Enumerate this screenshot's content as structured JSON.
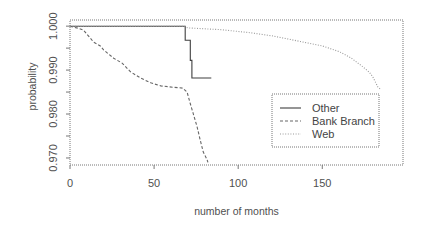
{
  "chart_data": {
    "type": "line",
    "title": "",
    "xlabel": "number of months",
    "ylabel": "probability",
    "xlim": [
      0,
      198
    ],
    "ylim": [
      0.9684,
      1.0014
    ],
    "grid": false,
    "legend_position": "inside-right",
    "xticks": [
      0,
      50,
      100,
      150
    ],
    "xtick_labels": [
      "0",
      "50",
      "100",
      "150"
    ],
    "yticks": [
      0.97,
      0.975,
      0.98,
      0.985,
      0.99,
      0.995,
      1.0
    ],
    "ytick_labels": [
      "0.970",
      "",
      "0.980",
      "",
      "0.990",
      "",
      "1.000"
    ],
    "series": [
      {
        "name": "Other",
        "line_style": "solid",
        "color": "#3f3f3f",
        "step": true,
        "points": [
          [
            0,
            1.0
          ],
          [
            68.5,
            1.0
          ],
          [
            68.5,
            0.9968
          ],
          [
            71.5,
            0.9968
          ],
          [
            71.5,
            0.9922
          ],
          [
            72.5,
            0.9922
          ],
          [
            72.5,
            0.9882
          ],
          [
            84,
            0.9882
          ]
        ]
      },
      {
        "name": "Bank Branch",
        "line_style": "dashed",
        "color": "#666666",
        "step": false,
        "points": [
          [
            0,
            1.0
          ],
          [
            5,
            0.9995
          ],
          [
            8,
            0.9991
          ],
          [
            14,
            0.9964
          ],
          [
            18,
            0.9955
          ],
          [
            20,
            0.9946
          ],
          [
            26,
            0.9927
          ],
          [
            31,
            0.9916
          ],
          [
            36,
            0.9896
          ],
          [
            42,
            0.9882
          ],
          [
            48,
            0.9871
          ],
          [
            54,
            0.9864
          ],
          [
            61,
            0.9861
          ],
          [
            67,
            0.9859
          ],
          [
            69.6,
            0.985
          ],
          [
            71.4,
            0.9825
          ],
          [
            73.2,
            0.9802
          ],
          [
            75.6,
            0.9771
          ],
          [
            77.4,
            0.9741
          ],
          [
            79.2,
            0.9714
          ],
          [
            81.5,
            0.9696
          ],
          [
            82,
            0.969
          ]
        ]
      },
      {
        "name": "Web",
        "line_style": "dotted",
        "color": "#9a9a9a",
        "step": false,
        "points": [
          [
            0,
            1.0
          ],
          [
            68,
            1.0
          ],
          [
            70,
            0.9996
          ],
          [
            90,
            0.9992
          ],
          [
            107,
            0.9985
          ],
          [
            120,
            0.9978
          ],
          [
            137,
            0.9965
          ],
          [
            150,
            0.9955
          ],
          [
            160,
            0.9942
          ],
          [
            167,
            0.9928
          ],
          [
            174,
            0.9908
          ],
          [
            178,
            0.9895
          ],
          [
            180,
            0.9885
          ],
          [
            183,
            0.9862
          ],
          [
            185,
            0.9855
          ]
        ]
      }
    ]
  },
  "legend": {
    "items": [
      {
        "label": "Other"
      },
      {
        "label": "Bank Branch"
      },
      {
        "label": "Web"
      }
    ]
  }
}
